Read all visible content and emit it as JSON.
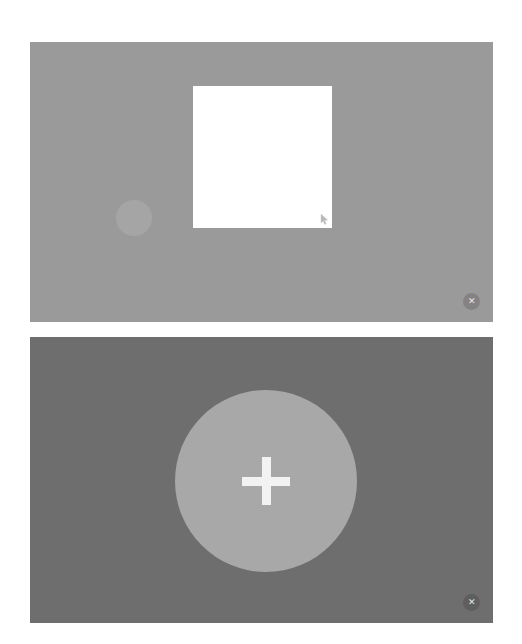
{
  "page": {
    "background_color": "#ffffff",
    "width": 522,
    "height": 644
  },
  "panels": [
    {
      "id": "top-preview-panel",
      "name": "upper-media-panel",
      "background_color": "#9a9a9a",
      "bounds": {
        "x": 30,
        "y": 42,
        "width": 463,
        "height": 280
      },
      "elements": {
        "document_square": {
          "name": "white-document-square",
          "color": "#ffffff",
          "bounds": {
            "x": 193,
            "y": 86,
            "width": 139,
            "height": 142
          }
        },
        "soft_dot": {
          "name": "light-gray-dot",
          "color": "#a5a5a5",
          "bounds": {
            "x": 116,
            "y": 200,
            "width": 36,
            "height": 36
          }
        },
        "resize_cursor": {
          "name": "resize-cursor-arrow",
          "color": "#b4b4b4",
          "bounds": {
            "x": 320,
            "y": 212,
            "width": 10,
            "height": 12
          }
        }
      },
      "close_button": {
        "name": "close-button",
        "glyph": "✕",
        "label": "Close",
        "background_color": "#838383",
        "glyph_color": "#e8e8e8"
      }
    },
    {
      "id": "bottom-action-panel",
      "name": "lower-media-panel",
      "background_color": "#6e6e6e",
      "bounds": {
        "x": 30,
        "y": 337,
        "width": 463,
        "height": 286
      },
      "elements": {
        "circle_button": {
          "name": "add-circle-button",
          "color": "#a8a8a8",
          "bounds": {
            "x": 175,
            "y": 390,
            "width": 182,
            "height": 182
          },
          "icon": {
            "name": "plus-icon",
            "glyph": "+",
            "color": "#f2f2f2",
            "size": 48,
            "stroke": 9
          }
        }
      },
      "close_button": {
        "name": "close-button",
        "glyph": "✕",
        "label": "Close",
        "background_color": "#5e5e5e",
        "glyph_color": "#e8e8e8"
      }
    }
  ]
}
